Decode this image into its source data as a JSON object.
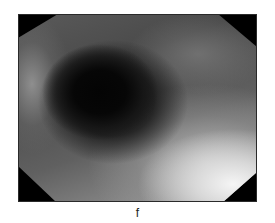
{
  "figure": {
    "panel_label": "f",
    "image_description": "grayscale endoscopic view with dark lumen on the left and bright mucosa on the lower right",
    "colors": {
      "background": "#ffffff",
      "mask": "#000000",
      "label": "#222222"
    }
  }
}
